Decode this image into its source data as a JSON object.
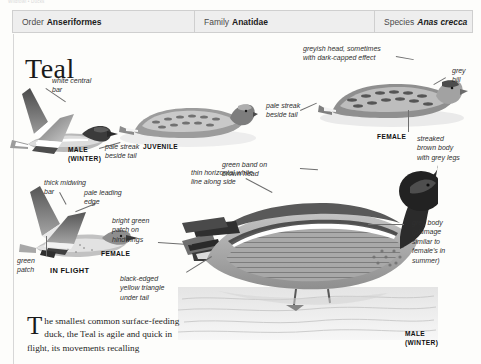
{
  "running_head": "Wildfowl • Ducks",
  "header": {
    "columns": [
      {
        "key": "Order",
        "value": "Anseriformes",
        "italic": false
      },
      {
        "key": "Family",
        "value": "Anatidae",
        "italic": false
      },
      {
        "key": "Species",
        "value": "Anas crecca",
        "italic": true
      }
    ]
  },
  "title": "Teal",
  "annotations": {
    "white_central_bar": "white central\nbar",
    "pale_streak_beside_tail_left": "pale streak\nbeside tail",
    "thick_midwing_bar": "thick midwing\nbar",
    "pale_leading_edge": "pale leading\nedge",
    "bright_green_patch": "bright green\npatch on\nhindwings",
    "green_patch": "green\npatch",
    "greyish_head": "greyish head, sometimes\nwith dark-capped effect",
    "grey_bill": "grey\nbill",
    "pale_streak_beside_tail_right": "pale streak\nbeside tail",
    "streaked_brown_body": "streaked\nbrown body\nwith grey legs",
    "green_band_on_brown_head": "green band on\nbrown head",
    "thin_horizontal_white_line": "thin horizontal white\nline along side",
    "grey_body": "grey body\n(plumage\nsimilar to\nfemale's in\nsummer)",
    "black_edged_yellow_triangle": "black-edged\nyellow triangle\nunder tail"
  },
  "tags": {
    "male_winter_flight": "MALE\n(WINTER)",
    "juvenile": "JUVENILE",
    "female_flight": "FEMALE",
    "in_flight": "IN FLIGHT",
    "female_swimming": "FEMALE",
    "male_winter_swimming": "MALE\n(WINTER)"
  },
  "body_text": {
    "dropcap": "T",
    "text": "he smallest common surface-feeding duck, the Teal is agile and quick in flight, its movements recalling"
  },
  "colors": {
    "header_band": "#eeeeee",
    "header_border": "#cfcfcf",
    "page": "#fdfdfb",
    "text": "#1e1e1e",
    "leader": "#6e6e6e",
    "plumage_dark": "#3a3a3a",
    "plumage_mid": "#8d8d8d",
    "plumage_light": "#d8d8d8",
    "water": "#e9e9e9"
  }
}
